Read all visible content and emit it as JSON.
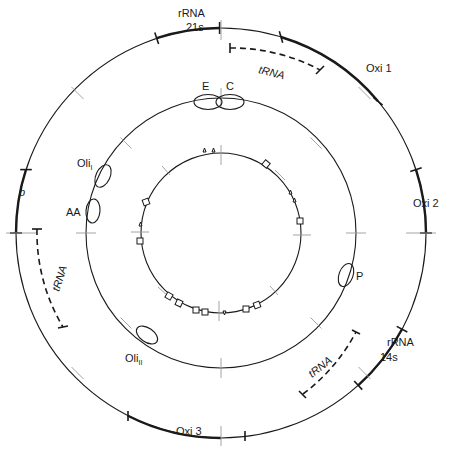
{
  "figure": {
    "type": "circular genome map (mitochondrial DNA)",
    "rings": [
      {
        "id": "outer",
        "label": "gene map",
        "radius": 205
      },
      {
        "id": "middle",
        "label": "drug-resistance / marker loci",
        "radius": 135
      },
      {
        "id": "inner",
        "label": "restriction / marker sites",
        "radius": 80
      }
    ]
  },
  "outer_ring": {
    "labels": {
      "rrna21s_line1": "rRNA",
      "rrna21s_line2": "21s",
      "trna_top": "tRNA",
      "oxi1": "Oxi 1",
      "oxi2": "Oxi 2",
      "rrna14s_line1": "rRNA",
      "rrna14s_line2": "14s",
      "trna_bottom": "tRNA",
      "oxi3": "Oxi 3",
      "trna_left": "tRNA",
      "b": "b"
    }
  },
  "middle_ring": {
    "loci": {
      "e": "E",
      "c": "C",
      "oli1_base": "Oli",
      "oli1_sub": "I",
      "aa": "AA",
      "p": "P",
      "oli2_base": "Oli",
      "oli2_sub": "II"
    }
  },
  "inner_ring": {
    "marker_count_squares": 13,
    "marker_count_triangles": 6
  },
  "colors": {
    "line": "#1a1a1a",
    "tick": "#9a9a9a",
    "background": "#ffffff"
  }
}
